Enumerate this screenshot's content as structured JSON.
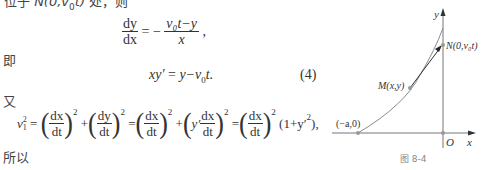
{
  "top_line": {
    "prefix": "位于 ",
    "point": "N(0,v",
    "sub": "0",
    "point_end": "t)",
    "suffix": " 处，则"
  },
  "eq_dydx": {
    "num_lhs": "dy",
    "den_lhs": "dx",
    "eq": "= −",
    "num_rhs": "v₀t−y",
    "den_rhs": "x",
    "trail": ","
  },
  "label_ji": "即",
  "eq4": {
    "text_lhs": "xy′",
    "eq": " = ",
    "rhs": "y−v",
    "sub": "0",
    "rhs_end": "t.",
    "number": "(4)"
  },
  "label_you": "又",
  "eq_v1": {
    "lhs": "v",
    "lhs_sup": "2",
    "lhs_sub": "1",
    "terms": [
      {
        "num": "dx",
        "den": "dt",
        "pow": "2"
      },
      {
        "num": "dy",
        "den": "dt",
        "pow": "2"
      },
      {
        "num": "dx",
        "den": "dt",
        "pow": "2"
      },
      {
        "prefix": "y′",
        "num": "dx",
        "den": "dt",
        "pow": "2"
      },
      {
        "num": "dx",
        "den": "dt",
        "pow": "2"
      }
    ],
    "tail": "(1+y′",
    "tail_sup": "2",
    "tail_end": "),"
  },
  "label_suoyi": "所以",
  "figure": {
    "caption": "图 8-4",
    "axis_y_label": "y",
    "axis_x_label": "x",
    "origin_label": "O",
    "point_a_label": "(−a,0)",
    "point_m_label": "M(x,y)",
    "point_n_label": "N(0,v₀t)",
    "colors": {
      "axis": "#777777",
      "curve": "#8a8a8a",
      "tangent": "#333333",
      "point": "#999999"
    }
  }
}
